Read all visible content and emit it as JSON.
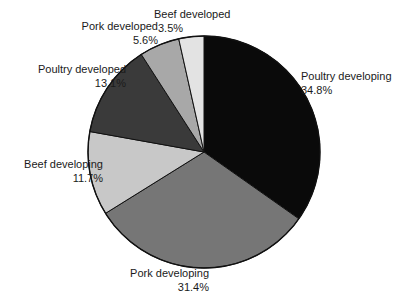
{
  "chart_data": {
    "type": "pie",
    "title": "",
    "subtitle": "",
    "legend_position": "outside-labels",
    "grid": false,
    "start_angle_deg": 0,
    "direction": "clockwise",
    "unit": "%",
    "categories": [
      "Poultry developing",
      "Pork developing",
      "Beef developing",
      "Poultry developed",
      "Pork developed",
      "Beef developed"
    ],
    "values": [
      34.8,
      31.4,
      11.7,
      13.1,
      5.6,
      3.5
    ],
    "slices": [
      {
        "label": "Poultry developing",
        "value": 34.8,
        "value_text": "34.8%",
        "color": "#0a0a0a",
        "start_pct": 0,
        "end_pct": 34.8
      },
      {
        "label": "Pork developing",
        "value": 31.4,
        "value_text": "31.4%",
        "color": "#767676",
        "start_pct": 34.8,
        "end_pct": 66.2
      },
      {
        "label": "Beef developing",
        "value": 11.7,
        "value_text": "11.7%",
        "color": "#c8c8c8",
        "start_pct": 66.2,
        "end_pct": 77.9
      },
      {
        "label": "Poultry developed",
        "value": 13.1,
        "value_text": "13.1%",
        "color": "#3a3a3a",
        "start_pct": 77.9,
        "end_pct": 91.0
      },
      {
        "label": "Pork developed",
        "value": 5.6,
        "value_text": "5.6%",
        "color": "#a8a8a8",
        "start_pct": 91.0,
        "end_pct": 96.6
      },
      {
        "label": "Beef developed",
        "value": 3.5,
        "value_text": "3.5%",
        "color": "#e3e3e3",
        "start_pct": 96.6,
        "end_pct": 100
      }
    ],
    "outline_color": "#111111"
  },
  "labels": {
    "beef_developed": {
      "name": "Beef developed",
      "pct": "3.5%"
    },
    "pork_developed": {
      "name": "Pork developed",
      "pct": "5.6%"
    },
    "poultry_developed": {
      "name": "Poultry developed",
      "pct": "13.1%"
    },
    "beef_developing": {
      "name": "Beef developing",
      "pct": "11.7%"
    },
    "pork_developing": {
      "name": "Pork developing",
      "pct": "31.4%"
    },
    "poultry_developing": {
      "name": "Poultry developing",
      "pct": "34.8%"
    }
  }
}
